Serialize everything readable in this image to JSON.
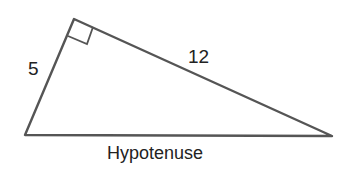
{
  "diagram": {
    "type": "right-triangle",
    "labels": {
      "short_leg": "5",
      "long_leg": "12",
      "hypotenuse": "Hypotenuse"
    },
    "colors": {
      "stroke": "#555555",
      "text": "#222222"
    }
  }
}
